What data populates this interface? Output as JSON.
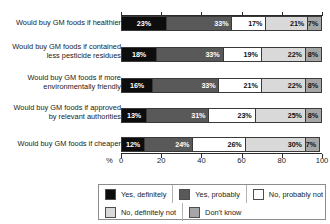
{
  "chart_data": {
    "type": "bar",
    "subtype": "horizontal-stacked-100",
    "title": "",
    "xlabel": "%",
    "ylabel": "",
    "xlim": [
      0,
      100
    ],
    "xticks": [
      0,
      20,
      40,
      60,
      80,
      100
    ],
    "grid": false,
    "legend_position": "bottom",
    "categories": [
      "Would buy GM foods if healthier",
      "Would buy GM foods if contained\nless pesticide residues",
      "Would buy GM foods if more\nenvironmentally friendly",
      "Would buy GM foods if approved\nby relevant authorities",
      "Would buy GM foods if cheaper"
    ],
    "series": [
      {
        "name": "Yes, definitely",
        "color": "#0d0d0d",
        "values": [
          23,
          18,
          16,
          13,
          12
        ]
      },
      {
        "name": "Yes, probably",
        "color": "#595959",
        "values": [
          33,
          33,
          33,
          31,
          24
        ]
      },
      {
        "name": "No, probably not",
        "color": "#ffffff",
        "values": [
          17,
          19,
          21,
          23,
          26
        ]
      },
      {
        "name": "No, definitely not",
        "color": "#d9d9d9",
        "values": [
          21,
          22,
          22,
          25,
          30
        ]
      },
      {
        "name": "Don't know",
        "color": "#a6a6a6",
        "values": [
          7,
          8,
          8,
          8,
          7
        ]
      }
    ],
    "value_labels": [
      [
        "23%",
        "33%",
        "17%",
        "21%",
        "7%"
      ],
      [
        "18%",
        "33%",
        "19%",
        "22%",
        "8%"
      ],
      [
        "16%",
        "33%",
        "21%",
        "22%",
        "8%"
      ],
      [
        "13%",
        "31%",
        "23%",
        "25%",
        "8%"
      ],
      [
        "12%",
        "24%",
        "26%",
        "30%",
        "7%"
      ]
    ],
    "xticklabels": [
      "0",
      "20",
      "40",
      "60",
      "80",
      "100"
    ],
    "legend": [
      {
        "label": "Yes, definitely",
        "color": "#0d0d0d"
      },
      {
        "label": "Yes, probably",
        "color": "#595959"
      },
      {
        "label": "No, probably not",
        "color": "#ffffff"
      },
      {
        "label": "No, definitely not",
        "color": "#d9d9d9"
      },
      {
        "label": "Don't know",
        "color": "#a6a6a6"
      }
    ]
  }
}
